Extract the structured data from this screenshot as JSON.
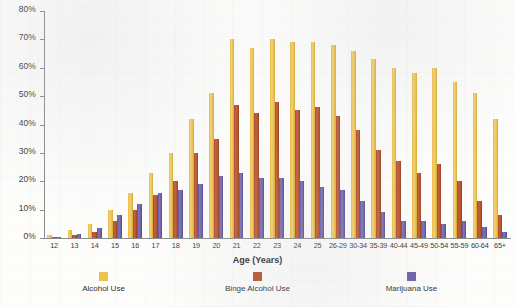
{
  "chart_data": {
    "type": "bar",
    "title": "",
    "xlabel": "Age (Years)",
    "ylabel": "",
    "ylim": [
      0,
      80
    ],
    "ytick_labels": [
      "80%",
      "70%",
      "60%",
      "50%",
      "40%",
      "30%",
      "20%",
      "10%",
      "0%"
    ],
    "ytick_values": [
      80,
      70,
      60,
      50,
      40,
      30,
      20,
      10,
      0
    ],
    "grid": false,
    "legend_position": "bottom",
    "categories": [
      "12",
      "13",
      "14",
      "15",
      "16",
      "17",
      "18",
      "19",
      "20",
      "21",
      "22",
      "23",
      "24",
      "25",
      "26-29",
      "30-34",
      "35-39",
      "40-44",
      "45-49",
      "50-54",
      "55-59",
      "60-64",
      "65+"
    ],
    "series": [
      {
        "name": "Alcohol Use",
        "color": "#edc14a",
        "values": [
          1,
          3,
          5,
          10,
          16,
          23,
          30,
          42,
          51,
          70,
          67,
          70,
          69,
          69,
          68,
          66,
          63,
          60,
          58,
          60,
          55,
          51,
          42
        ]
      },
      {
        "name": "Binge Alcohol Use",
        "color": "#b5512e",
        "values": [
          0.5,
          1,
          2,
          6,
          10,
          15,
          20,
          30,
          35,
          47,
          44,
          48,
          45,
          46,
          43,
          38,
          31,
          27,
          23,
          26,
          20,
          13,
          8
        ]
      },
      {
        "name": "Marijuana Use",
        "color": "#6f5fa8",
        "values": [
          0.5,
          1.5,
          3.5,
          8,
          12,
          16,
          17,
          19,
          22,
          23,
          21,
          21,
          20,
          18,
          17,
          13,
          9,
          6,
          6,
          5,
          6,
          4,
          2
        ]
      }
    ]
  },
  "axis": {
    "x_title": "Age (Years)"
  },
  "legend": {
    "items": [
      {
        "label": "Alcohol Use",
        "key": "alcohol"
      },
      {
        "label": "Binge Alcohol Use",
        "key": "binge"
      },
      {
        "label": "Marijuana Use",
        "key": "marijuana"
      }
    ]
  }
}
